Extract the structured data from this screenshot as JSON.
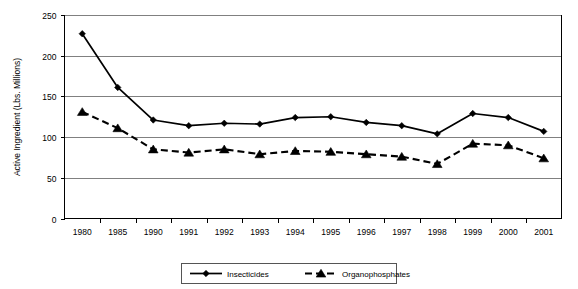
{
  "chart_data": {
    "type": "line",
    "title": "",
    "xlabel": "",
    "ylabel": "Active Ingredient (Lbs. Millions)",
    "categories": [
      "1980",
      "1985",
      "1990",
      "1991",
      "1992",
      "1993",
      "1994",
      "1995",
      "1996",
      "1997",
      "1998",
      "1999",
      "2000",
      "2001"
    ],
    "ylim": [
      0,
      250
    ],
    "yticks": [
      0,
      50,
      100,
      150,
      200,
      250
    ],
    "ytick_labels": [
      "0",
      "50",
      "100",
      "150",
      "200",
      "250"
    ],
    "grid": true,
    "legend_position": "bottom",
    "series": [
      {
        "name": "Insecticides",
        "marker": "diamond",
        "line_style": "solid",
        "values": [
          227,
          161,
          121,
          114,
          117,
          116,
          124,
          125,
          118,
          114,
          104,
          129,
          124,
          107
        ]
      },
      {
        "name": "Organophosphates",
        "marker": "triangle",
        "line_style": "dashed",
        "values": [
          131,
          111,
          85,
          81,
          85,
          79,
          83,
          82,
          79,
          76,
          67,
          92,
          90,
          74
        ]
      }
    ]
  },
  "legend": {
    "items": [
      {
        "label": "Insecticides",
        "marker": "diamond",
        "line_style": "solid"
      },
      {
        "label": "Organophosphates",
        "marker": "triangle",
        "line_style": "dashed"
      }
    ]
  },
  "axes": {
    "y_title": "Active Ingredient (Lbs. Millions)"
  }
}
